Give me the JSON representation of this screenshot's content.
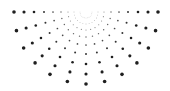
{
  "graphic": {
    "name": "halftone-sunburst",
    "background": "#ffffff",
    "dot_color": "#1f1f1f",
    "center": [
      86,
      12
    ],
    "ray_count": 13,
    "angle_start_deg": 180,
    "angle_end_deg": 0,
    "rings": [
      {
        "r": 6,
        "size": 0.35,
        "opacity": 0.35
      },
      {
        "r": 12,
        "size": 0.45,
        "opacity": 0.45
      },
      {
        "r": 18,
        "size": 0.55,
        "opacity": 0.55
      },
      {
        "r": 25,
        "size": 0.7,
        "opacity": 0.7
      },
      {
        "r": 33,
        "size": 0.85,
        "opacity": 0.8
      },
      {
        "r": 42,
        "size": 1.0,
        "opacity": 0.9
      },
      {
        "r": 52,
        "size": 1.3,
        "opacity": 1.0
      },
      {
        "r": 62,
        "size": 1.55,
        "opacity": 1.0
      },
      {
        "r": 72,
        "size": 1.8,
        "opacity": 1.0
      }
    ]
  }
}
